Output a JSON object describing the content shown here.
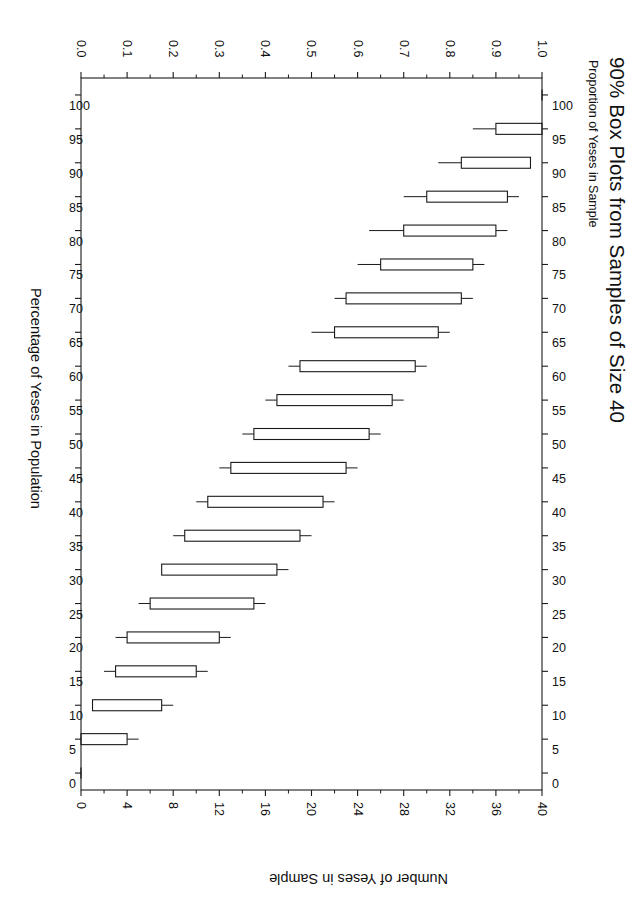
{
  "chart_data": {
    "type": "box",
    "title": "90% Box Plots from Samples of Size 40",
    "subtitle": "Proportion of Yeses in Sample",
    "xlabel": "Percentage of Yeses in Population",
    "ylabel": "Proportion of Yeses in Sample",
    "secondary_ylabel": "Number of Yeses in Sample",
    "orientation": "rotated-90-landscape",
    "grid": false,
    "legend": null,
    "sample_size": 40,
    "interval_level": "90%",
    "xlim": [
      100,
      0
    ],
    "ylim": [
      0.0,
      1.0
    ],
    "y2lim": [
      0,
      40
    ],
    "x_ticks_top": [
      "100",
      "95",
      "90",
      "85",
      "80",
      "75",
      "70",
      "65",
      "60",
      "55",
      "50",
      "45",
      "40",
      "35",
      "30",
      "25",
      "20",
      "15",
      "10",
      "5",
      "0"
    ],
    "x_ticks_bottom": [
      "100",
      "95",
      "90",
      "85",
      "80",
      "75",
      "70",
      "65",
      "60",
      "55",
      "50",
      "45",
      "40",
      "35",
      "30",
      "25",
      "20",
      "15",
      "10",
      "5",
      "0"
    ],
    "y_ticks": [
      "0.0",
      "0.1",
      "0.2",
      "0.3",
      "0.4",
      "0.5",
      "0.6",
      "0.7",
      "0.8",
      "0.9",
      "1.0"
    ],
    "y_minor_ticks": [
      0.05,
      0.15,
      0.25,
      0.35,
      0.45,
      0.55,
      0.65,
      0.75,
      0.85,
      0.95
    ],
    "y2_ticks": [
      "0",
      "4",
      "8",
      "12",
      "16",
      "20",
      "24",
      "28",
      "32",
      "36",
      "40"
    ],
    "y2_minor_ticks": [
      2,
      6,
      10,
      14,
      18,
      22,
      26,
      30,
      34,
      38
    ],
    "categories": [
      100,
      95,
      90,
      85,
      80,
      75,
      70,
      65,
      60,
      55,
      50,
      45,
      40,
      35,
      30,
      25,
      20,
      15,
      10,
      5,
      0
    ],
    "boxes": [
      {
        "p": 100,
        "lower_whisker": 1.0,
        "q1": 1.0,
        "q3": 1.0,
        "upper_whisker": 1.0
      },
      {
        "p": 95,
        "lower_whisker": 0.85,
        "q1": 0.9,
        "q3": 1.0,
        "upper_whisker": 1.0
      },
      {
        "p": 90,
        "lower_whisker": 0.775,
        "q1": 0.825,
        "q3": 0.975,
        "upper_whisker": 0.975
      },
      {
        "p": 85,
        "lower_whisker": 0.7,
        "q1": 0.75,
        "q3": 0.925,
        "upper_whisker": 0.95
      },
      {
        "p": 80,
        "lower_whisker": 0.625,
        "q1": 0.7,
        "q3": 0.9,
        "upper_whisker": 0.925
      },
      {
        "p": 75,
        "lower_whisker": 0.6,
        "q1": 0.65,
        "q3": 0.85,
        "upper_whisker": 0.875
      },
      {
        "p": 70,
        "lower_whisker": 0.55,
        "q1": 0.575,
        "q3": 0.825,
        "upper_whisker": 0.85
      },
      {
        "p": 65,
        "lower_whisker": 0.5,
        "q1": 0.55,
        "q3": 0.775,
        "upper_whisker": 0.8
      },
      {
        "p": 60,
        "lower_whisker": 0.45,
        "q1": 0.475,
        "q3": 0.725,
        "upper_whisker": 0.75
      },
      {
        "p": 55,
        "lower_whisker": 0.4,
        "q1": 0.425,
        "q3": 0.675,
        "upper_whisker": 0.7
      },
      {
        "p": 50,
        "lower_whisker": 0.35,
        "q1": 0.375,
        "q3": 0.625,
        "upper_whisker": 0.65
      },
      {
        "p": 45,
        "lower_whisker": 0.3,
        "q1": 0.325,
        "q3": 0.575,
        "upper_whisker": 0.6
      },
      {
        "p": 40,
        "lower_whisker": 0.25,
        "q1": 0.275,
        "q3": 0.525,
        "upper_whisker": 0.55
      },
      {
        "p": 35,
        "lower_whisker": 0.2,
        "q1": 0.225,
        "q3": 0.475,
        "upper_whisker": 0.5
      },
      {
        "p": 30,
        "lower_whisker": 0.175,
        "q1": 0.175,
        "q3": 0.425,
        "upper_whisker": 0.45
      },
      {
        "p": 25,
        "lower_whisker": 0.125,
        "q1": 0.15,
        "q3": 0.375,
        "upper_whisker": 0.4
      },
      {
        "p": 20,
        "lower_whisker": 0.075,
        "q1": 0.1,
        "q3": 0.3,
        "upper_whisker": 0.325
      },
      {
        "p": 15,
        "lower_whisker": 0.05,
        "q1": 0.075,
        "q3": 0.25,
        "upper_whisker": 0.275
      },
      {
        "p": 10,
        "lower_whisker": 0.025,
        "q1": 0.025,
        "q3": 0.175,
        "upper_whisker": 0.2
      },
      {
        "p": 5,
        "lower_whisker": 0.0,
        "q1": 0.0,
        "q3": 0.1,
        "upper_whisker": 0.125
      },
      {
        "p": 0,
        "lower_whisker": 0.0,
        "q1": 0.0,
        "q3": 0.0,
        "upper_whisker": 0.0
      }
    ],
    "style": {
      "line_color": "#1a1a1a",
      "box_fill": "none",
      "background": "#ffffff",
      "box_width_px": 11
    }
  },
  "page": {
    "corner_mark": ""
  }
}
